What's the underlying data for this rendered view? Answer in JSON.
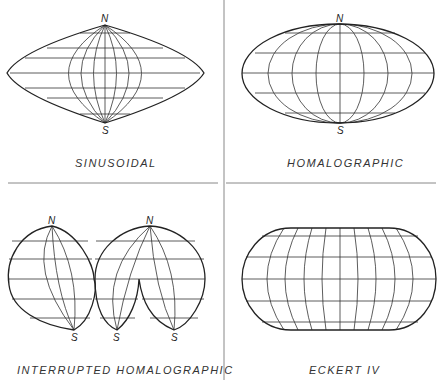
{
  "panels": [
    {
      "id": "sinusoidal",
      "label": "SINUSOIDAL",
      "poles": {
        "north": "N",
        "south": "S"
      }
    },
    {
      "id": "homalographic",
      "label": "HOMALOGRAPHIC",
      "poles": {
        "north": "N",
        "south": "S"
      }
    },
    {
      "id": "interrupted-homalographic",
      "label": "INTERRUPTED HOMALOGRAPHIC",
      "poles": {
        "north": [
          "N",
          "N"
        ],
        "south": [
          "S",
          "S",
          "S"
        ]
      }
    },
    {
      "id": "eckert-iv",
      "label": "ECKERT IV"
    }
  ],
  "colors": {
    "line": "#222222",
    "background": "#ffffff",
    "divider": "#888888"
  }
}
